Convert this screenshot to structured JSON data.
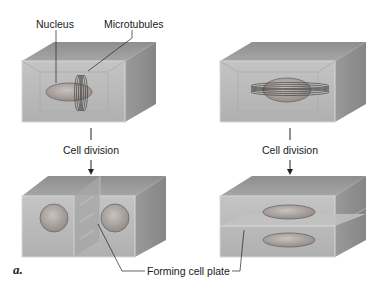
{
  "figure": {
    "panel_letter": "a.",
    "labels": {
      "nucleus": "Nucleus",
      "microtubules": "Microtubules",
      "cell_division_left": "Cell division",
      "cell_division_right": "Cell division",
      "forming_cell_plate": "Forming cell plate"
    },
    "panels": [
      {
        "id": "top-left",
        "description": "Cell with elongated nucleus; microtubule band encircles it vertically"
      },
      {
        "id": "top-right",
        "description": "Cell with elongated nucleus; microtubule band encircles it horizontally"
      },
      {
        "id": "bottom-left",
        "description": "Two daughter nuclei separated by a vertical forming cell plate"
      },
      {
        "id": "bottom-right",
        "description": "Two daughter nuclei separated by a horizontal forming cell plate"
      }
    ],
    "colors": {
      "cell_front": "#b9b9b9",
      "cell_top": "#9d9d9d",
      "cell_side": "#8f8f8f",
      "nucleus": "#a59f9b",
      "line": "#222222"
    }
  }
}
